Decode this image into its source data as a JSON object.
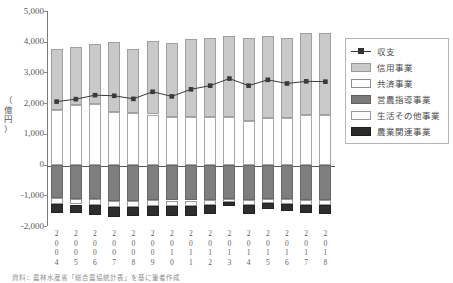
{
  "chart_data": {
    "type": "bar",
    "title": "",
    "xlabel": "",
    "ylabel": "（億円）",
    "ylim": [
      -2000,
      5000
    ],
    "ytick_step": 1000,
    "grid": false,
    "legend_position": "right",
    "stacked": true,
    "categories": [
      "2004",
      "2005",
      "2006",
      "2007",
      "2008",
      "2009",
      "2010",
      "2011",
      "2012",
      "2013",
      "2014",
      "2015",
      "2016",
      "2017",
      "2018"
    ],
    "yticks": [
      "5,000",
      "4,000",
      "3,000",
      "2,000",
      "1,000",
      "0",
      "-1,000",
      "-2,000"
    ],
    "series": [
      {
        "name": "信用事業",
        "type": "bar",
        "color": "#c9c9c9",
        "values": [
          1980,
          1890,
          1960,
          2280,
          2060,
          2400,
          2400,
          2540,
          2580,
          2620,
          2700,
          2670,
          2580,
          2680,
          2690
        ]
      },
      {
        "name": "共済事業",
        "type": "bar",
        "color": "#ffffff",
        "values": [
          1790,
          1930,
          1980,
          1720,
          1690,
          1630,
          1550,
          1560,
          1540,
          1550,
          1430,
          1530,
          1530,
          1610,
          1600
        ]
      },
      {
        "name": "営農指導事業",
        "type": "bar",
        "color": "#7e7e7e",
        "values": [
          -1090,
          -1120,
          -1120,
          -1180,
          -1180,
          -1160,
          -1170,
          -1170,
          -1150,
          -1120,
          -1150,
          -1120,
          -1110,
          -1140,
          -1150
        ]
      },
      {
        "name": "生活その他事業",
        "type": "bar",
        "color": "#fbfbfb",
        "values": [
          -190,
          -180,
          -190,
          -200,
          -190,
          -190,
          -190,
          -190,
          -180,
          -110,
          -170,
          -130,
          -160,
          -170,
          -170
        ]
      },
      {
        "name": "農業関連事業",
        "type": "bar",
        "color": "#2e2e2e",
        "values": [
          -310,
          -290,
          -320,
          -330,
          -310,
          -310,
          -320,
          -310,
          -290,
          -120,
          -290,
          -190,
          -240,
          -280,
          -280
        ]
      },
      {
        "name": "収支",
        "type": "line",
        "color": "#3a3a3a",
        "marker": "square",
        "values": [
          2050,
          2130,
          2260,
          2240,
          2140,
          2370,
          2220,
          2450,
          2570,
          2800,
          2570,
          2760,
          2640,
          2710,
          2700
        ]
      }
    ]
  },
  "legend": {
    "items": [
      {
        "label": "収支",
        "key": "line"
      },
      {
        "label": "信用事業",
        "key": "shinyo"
      },
      {
        "label": "共済事業",
        "key": "kyosai"
      },
      {
        "label": "営農指導事業",
        "key": "einou"
      },
      {
        "label": "生活その他事業",
        "key": "seikatsu"
      },
      {
        "label": "農業関連事業",
        "key": "nougyo"
      }
    ]
  },
  "source_note": "資料：農林水産省「総合農協統計表」を基に筆者作成"
}
